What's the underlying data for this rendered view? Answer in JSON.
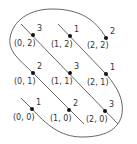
{
  "diagram": {
    "type": "lattice-torus-diagram",
    "line_color": "#555555",
    "dot_color": "#111111",
    "points": [
      {
        "coord": "(0, 2)",
        "value": "3",
        "x": 33,
        "y": 35
      },
      {
        "coord": "(1, 2)",
        "value": "1",
        "x": 70,
        "y": 36
      },
      {
        "coord": "(2, 2)",
        "value": "2",
        "x": 106,
        "y": 38
      },
      {
        "coord": "(0, 1)",
        "value": "2",
        "x": 33,
        "y": 73
      },
      {
        "coord": "(1, 1)",
        "value": "3",
        "x": 70,
        "y": 73
      },
      {
        "coord": "(2, 1)",
        "value": "1",
        "x": 106,
        "y": 74
      },
      {
        "coord": "(0, 0)",
        "value": "1",
        "x": 32,
        "y": 109
      },
      {
        "coord": "(1, 0)",
        "value": "2",
        "x": 69,
        "y": 110
      },
      {
        "coord": "(2, 0)",
        "value": "3",
        "x": 105,
        "y": 111
      }
    ]
  }
}
